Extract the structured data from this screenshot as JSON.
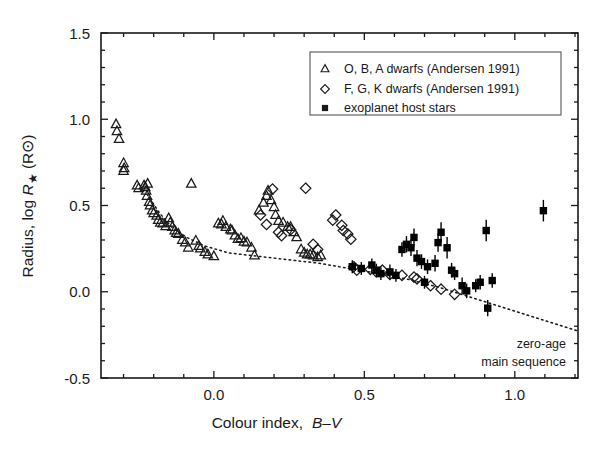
{
  "figure": {
    "background": "#ffffff",
    "frame_color": "#1a1a1a"
  },
  "axes": {
    "x": {
      "label_main": "Colour index,",
      "label_math": "B–V",
      "ticks": [
        "0.0",
        "0.5",
        "1.0"
      ],
      "tick_values": [
        0.0,
        0.5,
        1.0
      ],
      "range": [
        -0.375,
        1.21
      ],
      "minor_step": 0.1
    },
    "y": {
      "label_main": "Radius, log",
      "label_math": "R",
      "label_star": "★",
      "label_units": "(R⊙)",
      "ticks": [
        "1.5",
        "1.0",
        "0.5",
        "0.0",
        "-0.5"
      ],
      "tick_values": [
        1.5,
        1.0,
        0.5,
        0.0,
        -0.5
      ],
      "range": [
        -0.5,
        1.5
      ],
      "minor_step": 0.1
    }
  },
  "legend": {
    "border_color": "#555555",
    "entries": [
      {
        "marker": "triangle",
        "label": "O, B, A dwarfs (Andersen 1991)"
      },
      {
        "marker": "diamond",
        "label": "F, G, K dwarfs (Andersen 1991)"
      },
      {
        "marker": "square",
        "label": "exoplanet host stars"
      }
    ]
  },
  "annotations": [
    {
      "name": "zams-line-1",
      "text": "zero-age"
    },
    {
      "name": "zams-line-2",
      "text": "main sequence"
    }
  ],
  "chart_data": {
    "type": "scatter",
    "title": "",
    "xlabel": "Colour index, B-V",
    "ylabel": "Radius, log R_star (R_sun)",
    "xlim": [
      -0.375,
      1.21
    ],
    "ylim": [
      -0.5,
      1.5
    ],
    "grid": false,
    "legend_position": "top-right",
    "series": [
      {
        "name": "O, B, A dwarfs (Andersen 1991)",
        "marker": "open-triangle",
        "color": "#1a1a1a",
        "points": [
          [
            -0.325,
            0.97
          ],
          [
            -0.322,
            0.93
          ],
          [
            -0.315,
            0.885
          ],
          [
            -0.3,
            0.745
          ],
          [
            -0.298,
            0.715
          ],
          [
            -0.3,
            0.7
          ],
          [
            -0.255,
            0.615
          ],
          [
            -0.25,
            0.6
          ],
          [
            -0.232,
            0.615
          ],
          [
            -0.228,
            0.605
          ],
          [
            -0.225,
            0.585
          ],
          [
            -0.222,
            0.555
          ],
          [
            -0.22,
            0.625
          ],
          [
            -0.215,
            0.52
          ],
          [
            -0.212,
            0.5
          ],
          [
            -0.205,
            0.47
          ],
          [
            -0.2,
            0.455
          ],
          [
            -0.19,
            0.44
          ],
          [
            -0.185,
            0.415
          ],
          [
            -0.178,
            0.4
          ],
          [
            -0.17,
            0.395
          ],
          [
            -0.16,
            0.38
          ],
          [
            -0.15,
            0.425
          ],
          [
            -0.145,
            0.4
          ],
          [
            -0.138,
            0.375
          ],
          [
            -0.13,
            0.355
          ],
          [
            -0.125,
            0.34
          ],
          [
            -0.118,
            0.335
          ],
          [
            -0.105,
            0.3
          ],
          [
            -0.095,
            0.285
          ],
          [
            -0.085,
            0.255
          ],
          [
            -0.075,
            0.625
          ],
          [
            -0.06,
            0.295
          ],
          [
            -0.05,
            0.265
          ],
          [
            -0.045,
            0.25
          ],
          [
            -0.03,
            0.23
          ],
          [
            -0.02,
            0.215
          ],
          [
            0.0,
            0.205
          ],
          [
            0.015,
            0.395
          ],
          [
            0.025,
            0.39
          ],
          [
            0.03,
            0.41
          ],
          [
            0.04,
            0.375
          ],
          [
            0.055,
            0.36
          ],
          [
            0.06,
            0.355
          ],
          [
            0.07,
            0.325
          ],
          [
            0.08,
            0.305
          ],
          [
            0.09,
            0.31
          ],
          [
            0.1,
            0.29
          ],
          [
            0.11,
            0.285
          ],
          [
            0.125,
            0.255
          ],
          [
            0.135,
            0.21
          ],
          [
            0.15,
            0.47
          ],
          [
            0.165,
            0.515
          ],
          [
            0.175,
            0.555
          ],
          [
            0.18,
            0.585
          ],
          [
            0.19,
            0.53
          ],
          [
            0.2,
            0.49
          ],
          [
            0.205,
            0.445
          ],
          [
            0.215,
            0.41
          ],
          [
            0.23,
            0.4
          ],
          [
            0.245,
            0.375
          ],
          [
            0.255,
            0.375
          ],
          [
            0.265,
            0.345
          ],
          [
            0.275,
            0.315
          ],
          [
            0.29,
            0.245
          ],
          [
            0.3,
            0.225
          ],
          [
            0.31,
            0.215
          ],
          [
            0.32,
            0.215
          ],
          [
            0.33,
            0.21
          ],
          [
            0.345,
            0.2
          ],
          [
            0.355,
            0.21
          ]
        ]
      },
      {
        "name": "F, G, K dwarfs (Andersen 1991)",
        "marker": "open-diamond",
        "color": "#1a1a1a",
        "points": [
          [
            0.155,
            0.445
          ],
          [
            0.175,
            0.39
          ],
          [
            0.195,
            0.595
          ],
          [
            0.215,
            0.345
          ],
          [
            0.225,
            0.325
          ],
          [
            0.255,
            0.36
          ],
          [
            0.305,
            0.6
          ],
          [
            0.33,
            0.275
          ],
          [
            0.345,
            0.245
          ],
          [
            0.395,
            0.415
          ],
          [
            0.405,
            0.445
          ],
          [
            0.425,
            0.385
          ],
          [
            0.43,
            0.355
          ],
          [
            0.445,
            0.335
          ],
          [
            0.455,
            0.305
          ],
          [
            0.465,
            0.145
          ],
          [
            0.475,
            0.125
          ],
          [
            0.52,
            0.13
          ],
          [
            0.54,
            0.115
          ],
          [
            0.56,
            0.125
          ],
          [
            0.585,
            0.1
          ],
          [
            0.625,
            0.095
          ],
          [
            0.665,
            0.085
          ],
          [
            0.675,
            0.075
          ],
          [
            0.72,
            0.035
          ],
          [
            0.755,
            0.015
          ],
          [
            0.8,
            -0.015
          ]
        ]
      },
      {
        "name": "exoplanet host stars",
        "marker": "filled-square",
        "color": "#000000",
        "has_error_bars": true,
        "points": [
          [
            0.46,
            0.145,
            0.02
          ],
          [
            0.49,
            0.135,
            0.02
          ],
          [
            0.525,
            0.155,
            0.02
          ],
          [
            0.54,
            0.125,
            0.02
          ],
          [
            0.555,
            0.105,
            0.02
          ],
          [
            0.585,
            0.115,
            0.025
          ],
          [
            0.605,
            0.095,
            0.02
          ],
          [
            0.625,
            0.245,
            0.025
          ],
          [
            0.64,
            0.275,
            0.03
          ],
          [
            0.655,
            0.255,
            0.03
          ],
          [
            0.665,
            0.315,
            0.035
          ],
          [
            0.675,
            0.195,
            0.03
          ],
          [
            0.69,
            0.175,
            0.025
          ],
          [
            0.7,
            0.055,
            0.02
          ],
          [
            0.71,
            0.145,
            0.025
          ],
          [
            0.735,
            0.165,
            0.03
          ],
          [
            0.745,
            0.285,
            0.035
          ],
          [
            0.755,
            0.345,
            0.04
          ],
          [
            0.775,
            0.255,
            0.045
          ],
          [
            0.79,
            0.125,
            0.025
          ],
          [
            0.8,
            0.105,
            0.02
          ],
          [
            0.825,
            0.035,
            0.03
          ],
          [
            0.84,
            0.005,
            0.025
          ],
          [
            0.87,
            0.035,
            0.02
          ],
          [
            0.885,
            0.055,
            0.025
          ],
          [
            0.905,
            0.355,
            0.045
          ],
          [
            0.91,
            -0.095,
            0.03
          ],
          [
            0.925,
            0.065,
            0.025
          ],
          [
            1.095,
            0.47,
            0.045
          ]
        ]
      }
    ],
    "reference_line": {
      "name": "zero-age main sequence",
      "style": "dotted",
      "color": "#1a1a1a",
      "points": [
        [
          -0.222,
          0.565
        ],
        [
          -0.18,
          0.455
        ],
        [
          -0.14,
          0.375
        ],
        [
          -0.09,
          0.315
        ],
        [
          -0.03,
          0.265
        ],
        [
          0.05,
          0.225
        ],
        [
          0.15,
          0.205
        ],
        [
          0.25,
          0.185
        ],
        [
          0.35,
          0.165
        ],
        [
          0.45,
          0.135
        ],
        [
          0.55,
          0.105
        ],
        [
          0.65,
          0.07
        ],
        [
          0.75,
          0.025
        ],
        [
          0.85,
          -0.03
        ],
        [
          0.95,
          -0.085
        ],
        [
          1.05,
          -0.14
        ],
        [
          1.15,
          -0.195
        ],
        [
          1.205,
          -0.225
        ]
      ]
    }
  }
}
